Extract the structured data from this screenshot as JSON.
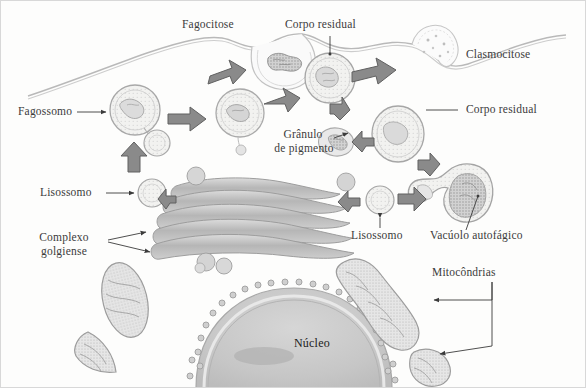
{
  "figure": {
    "language": "pt-BR",
    "background_color": "#fdfdfc",
    "ink_color": "#3b3b3b",
    "arrow_color": "#6f6f6f",
    "organelle_fill": "#cfcfcf",
    "nucleus_fill": "#c9c9c9"
  },
  "labels": {
    "fagocitose": "Fagocitose",
    "corpo_residual_top": "Corpo residual",
    "clasmocitose": "Clasmocitose",
    "fagossomo": "Fagossomo",
    "corpo_residual_right": "Corpo residual",
    "granulo_line1": "Grânulo",
    "granulo_line2": "de pigmento",
    "lisossomo_left": "Lisossomo",
    "lisossomo_center": "Lisossomo",
    "vacuolo_autofagico": "Vacúolo autofágico",
    "complexo_line1": "Complexo",
    "complexo_line2": "golgiense",
    "mitocondrias": "Mitocôndrias",
    "nucleo": "Núcleo"
  },
  "structures": [
    {
      "name": "cell-membrane",
      "kind": "membrane"
    },
    {
      "name": "phagocytosis-invagination",
      "kind": "membrane-pocket"
    },
    {
      "name": "phagosome",
      "kind": "vesicle"
    },
    {
      "name": "phagolysosome",
      "kind": "vesicle"
    },
    {
      "name": "residual-body-top",
      "kind": "vesicle"
    },
    {
      "name": "residual-body-right",
      "kind": "vesicle"
    },
    {
      "name": "pigment-granule",
      "kind": "granule"
    },
    {
      "name": "lysosome-left",
      "kind": "vesicle"
    },
    {
      "name": "lysosome-center",
      "kind": "vesicle"
    },
    {
      "name": "autophagic-vacuole",
      "kind": "vacuole"
    },
    {
      "name": "golgi-complex",
      "kind": "cisternae-stack"
    },
    {
      "name": "nucleus",
      "kind": "nucleus"
    },
    {
      "name": "mitochondrion-upper-left",
      "kind": "mitochondrion"
    },
    {
      "name": "mitochondrion-lower-left",
      "kind": "mitochondrion"
    },
    {
      "name": "mitochondrion-right-large",
      "kind": "mitochondrion"
    },
    {
      "name": "mitochondrion-right-small",
      "kind": "mitochondrion"
    }
  ],
  "process_arrows": [
    {
      "name": "arrow-phagocytosis-to-phagosome",
      "direction": "down-left"
    },
    {
      "name": "arrow-lysosome-to-phagosome",
      "direction": "up"
    },
    {
      "name": "arrow-phagosome-to-phagolysosome",
      "direction": "right"
    },
    {
      "name": "arrow-phagolysosome-to-residual-body",
      "direction": "up-right"
    },
    {
      "name": "arrow-residual-body-to-clasmocytosis",
      "direction": "right"
    },
    {
      "name": "arrow-residual-to-pigment-granule",
      "direction": "down"
    },
    {
      "name": "arrow-pigment-granule-return",
      "direction": "left"
    },
    {
      "name": "arrow-residual-down",
      "direction": "down"
    },
    {
      "name": "arrow-autophagy-to-residual",
      "direction": "up-right"
    },
    {
      "name": "arrow-lysosome-to-autophagic-vacuole",
      "direction": "right"
    },
    {
      "name": "arrow-golgi-to-lysosome",
      "direction": "left"
    }
  ]
}
